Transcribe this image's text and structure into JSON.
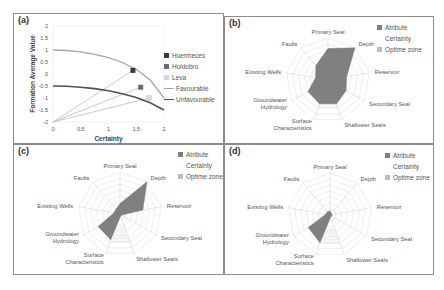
{
  "chart_data": [
    {
      "panel": "(a)",
      "type": "line",
      "title": "",
      "xlabel": "Certainty",
      "ylabel": "Formation Average Value",
      "xlim": [
        0,
        2
      ],
      "ylim": [
        -2,
        2
      ],
      "xticks": [
        "0",
        "0.5",
        "1",
        "1.5",
        "2"
      ],
      "yticks": [
        "2",
        "1.5",
        "1",
        "0.5",
        "0",
        "-0.5",
        "-1",
        "-1.5",
        "-2"
      ],
      "grid": false,
      "legend_position": "right",
      "series": [
        {
          "name": "Huermeces",
          "kind": "marker",
          "color": "#3a3a3a",
          "x": 1.44,
          "y": 0.15
        },
        {
          "name": "Huidobro",
          "kind": "marker",
          "color": "#6a6a6a",
          "x": 1.58,
          "y": -0.55
        },
        {
          "name": "Leva",
          "kind": "marker",
          "color": "#d8d8d8",
          "x": 1.73,
          "y": -1.0
        },
        {
          "name": "Favourable",
          "kind": "line",
          "color": "#a6a6a6",
          "x": [
            0,
            0.25,
            0.5,
            0.75,
            1.0,
            1.25,
            1.5,
            1.75,
            2.0
          ],
          "y": [
            1.0,
            0.98,
            0.92,
            0.82,
            0.68,
            0.48,
            0.2,
            -0.25,
            -1.0
          ]
        },
        {
          "name": "Unfavourable",
          "kind": "line",
          "color": "#505050",
          "x": [
            0,
            0.25,
            0.5,
            0.75,
            1.0,
            1.25,
            1.5,
            1.75,
            2.0
          ],
          "y": [
            -0.5,
            -0.51,
            -0.55,
            -0.61,
            -0.7,
            -0.82,
            -0.98,
            -1.2,
            -1.5
          ]
        }
      ],
      "connectors": [
        {
          "from": [
            0,
            -2
          ],
          "to": [
            1.44,
            0.15
          ]
        },
        {
          "from": [
            0,
            -2
          ],
          "to": [
            1.58,
            -0.55
          ]
        },
        {
          "from": [
            0,
            -2
          ],
          "to": [
            1.73,
            -1.0
          ]
        }
      ]
    },
    {
      "panel": "(b)",
      "type": "radar",
      "axes": [
        "Primary Seal",
        "Depth",
        "Reservoir",
        "Secondary Seal",
        "Shallower Seals",
        "Surface Characteristics",
        "Groundwater Hydrology",
        "Existing Wells",
        "Faults"
      ],
      "rings": 7,
      "legend": [
        "Atribute",
        "Certainty",
        "Optime zone"
      ],
      "series": [
        {
          "name": "Atribute",
          "color": "#808080",
          "values": [
            0.75,
            1.0,
            0.45,
            0.5,
            0.6,
            0.6,
            0.55,
            0.3,
            0.45
          ]
        },
        {
          "name": "Optime zone",
          "color": "#e6e6e6",
          "values": [
            0,
            0,
            0,
            0,
            0.72,
            0.72,
            0,
            0,
            0
          ]
        }
      ]
    },
    {
      "panel": "(c)",
      "type": "radar",
      "axes": [
        "Primary Seal",
        "Depth",
        "Reservoir",
        "Secondary Seal",
        "Shallower Seals",
        "Surface Characteristics",
        "Groundwater Hydrology",
        "Existing Wells",
        "Faults"
      ],
      "rings": 7,
      "legend": [
        "Atribute",
        "Certainty",
        "Optime zone"
      ],
      "series": [
        {
          "name": "Atribute",
          "color": "#808080",
          "values": [
            0.25,
            1.0,
            0.55,
            0.05,
            0.05,
            0.65,
            0.6,
            0.15,
            0.15
          ]
        },
        {
          "name": "Optime zone",
          "color": "#e6e6e6",
          "values": [
            0,
            0,
            0,
            0,
            0.72,
            0.72,
            0,
            0,
            0
          ]
        }
      ]
    },
    {
      "panel": "(d)",
      "type": "radar",
      "axes": [
        "Primary Seal",
        "Depth",
        "Reservoir",
        "Secondary Seal",
        "Shallower Seals",
        "Surface Characteristics",
        "Groundwater Hydrology",
        "Existing Wells",
        "Faults"
      ],
      "rings": 7,
      "legend": [
        "Atribute",
        "Certainty",
        "Optime zone"
      ],
      "series": [
        {
          "name": "Atribute",
          "color": "#808080",
          "values": [
            0.1,
            0.05,
            0.05,
            0.05,
            0.05,
            0.7,
            0.6,
            0.1,
            0.1
          ]
        },
        {
          "name": "Optime zone",
          "color": "#e6e6e6",
          "values": [
            0,
            0,
            0,
            0,
            0.72,
            0.72,
            0,
            0,
            0
          ]
        }
      ]
    }
  ],
  "panels": {
    "a": {
      "label": "(a)"
    },
    "b": {
      "label": "(b)"
    },
    "c": {
      "label": "(c)"
    },
    "d": {
      "label": "(d)"
    }
  },
  "legend_a": [
    "Huermeces",
    "Huidobro",
    "Leva",
    "Favourable",
    "Unfavourable"
  ],
  "radar_legend": [
    "Atribute",
    "Certainty",
    "Optime zone"
  ]
}
